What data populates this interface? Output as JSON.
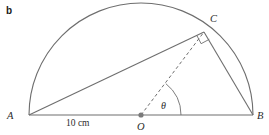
{
  "figure": {
    "part_label": "b",
    "background_color": "#ffffff",
    "stroke_color": "#6e6e6e",
    "text_color": "#2b2b2b",
    "labels": {
      "point_a": "A",
      "point_b": "B",
      "point_c": "C",
      "point_o": "O",
      "angle_theta": "θ",
      "dimension_ab": "10 cm"
    },
    "geometry": {
      "center": {
        "x": 141,
        "y": 115
      },
      "radius": 112,
      "point_a": {
        "x": 29,
        "y": 115
      },
      "point_b": {
        "x": 253,
        "y": 115
      },
      "point_c": {
        "x": 204,
        "y": 32
      },
      "theta_arc_radius": 40,
      "right_angle_at": "C"
    }
  }
}
